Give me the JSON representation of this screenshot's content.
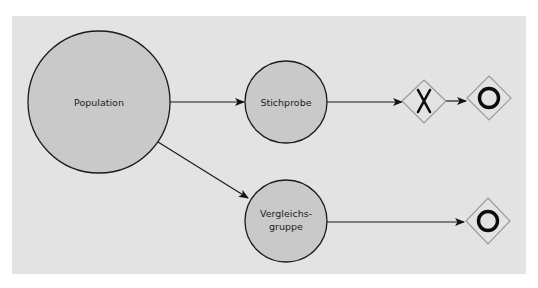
{
  "diagram": {
    "type": "flow",
    "colors": {
      "panel_bg": "#e3e3e3",
      "node_fill": "#c9c9c9",
      "node_stroke": "#1a1a1a",
      "gateway_stroke": "#9a9a9a",
      "symbol": "#0d0d0d"
    },
    "nodes": {
      "population": {
        "label": "Population"
      },
      "stichprobe": {
        "label": "Stichprobe"
      },
      "vergleichsgruppe": {
        "label_line1": "Vergleichs-",
        "label_line2": "gruppe"
      }
    },
    "gateways": [
      {
        "id": "exclusive",
        "symbol": "X",
        "icon": "exclusive-gateway-icon"
      },
      {
        "id": "end-1",
        "symbol": "O",
        "icon": "end-event-icon"
      },
      {
        "id": "end-2",
        "symbol": "O",
        "icon": "end-event-icon"
      }
    ],
    "edges": [
      {
        "from": "population",
        "to": "stichprobe"
      },
      {
        "from": "population",
        "to": "vergleichsgruppe"
      },
      {
        "from": "stichprobe",
        "to": "exclusive"
      },
      {
        "from": "exclusive",
        "to": "end-1"
      },
      {
        "from": "vergleichsgruppe",
        "to": "end-2"
      }
    ]
  }
}
